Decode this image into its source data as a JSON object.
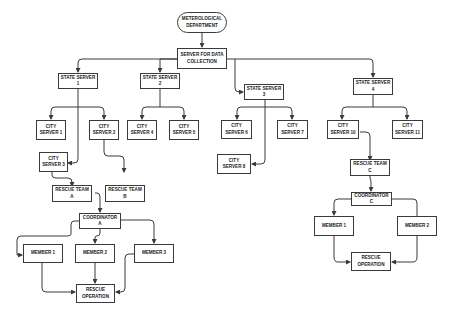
{
  "diagram": {
    "root": "METEROLOGICAL\nDEPARTMENT",
    "server": "SERVER FOR DATA\nCOLLECTION",
    "state_servers": [
      "STATE SERVER 1",
      "STATE SERVER 2",
      "STATE SERVER 3",
      "STATE SERVER 4"
    ],
    "city_servers": {
      "c1": "CITY\nSERVER 1",
      "c2": "CITY\nSERVER 2",
      "c3": "CITY\nSERVER 3",
      "c4": "CITY\nSERVER 4",
      "c5": "CITY\nSERVER 5",
      "c6": "CITY\nSERVER 6",
      "c7": "CITY\nSERVER 7",
      "c8": "CITY\nSERVER 8",
      "c10": "CITY\nSERVER 10",
      "c11": "CITY\nSERVER 11"
    },
    "rescue_teams": {
      "a": "RESCUE TEAM A",
      "b": "RESCUE TEAM B",
      "c": "RESCUE TEAM C"
    },
    "coordinators": {
      "a": "COORDINATOR A",
      "c": "COORDINATOR C"
    },
    "members_a": [
      "MEMBER 1",
      "MEMBER 2",
      "MEMBER 3"
    ],
    "members_c": [
      "MEMBER 1",
      "MEMBER 2"
    ],
    "rescue_op_a": "RESCUE\nOPERATION",
    "rescue_op_c": "RESCUE\nOPERATION"
  },
  "colors": {
    "line": "#3a3a3a",
    "box_border": "#3a3a3a",
    "background": "#ffffff"
  }
}
